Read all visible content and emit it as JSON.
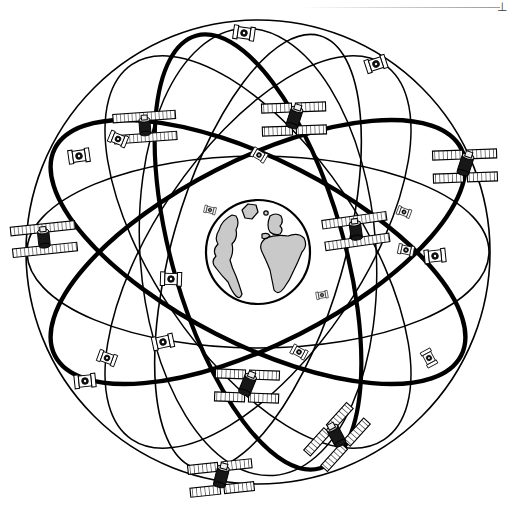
{
  "figure": {
    "background_color": "#ffffff",
    "line_color": "#000000",
    "earth": {
      "label": "Earth",
      "center_x": 258,
      "center_y": 252,
      "radius": 52,
      "ocean_fill": "#ffffff",
      "land_fill": "#c9c9c9",
      "outline_color": "#000000",
      "outline_width": 2.2,
      "view": "Atlantic hemisphere: North America, South America, Europe, Africa, Greenland"
    },
    "orbits": {
      "count": 9,
      "thick_color": "#000000",
      "thin_color": "#000000",
      "thick_width": 4.2,
      "thin_width": 1.5,
      "planes": [
        {
          "name": "outer-sphere-rim",
          "rx": 232,
          "ry": 232,
          "rotation": 0,
          "weight": "thin"
        },
        {
          "name": "equatorial-wide-thin",
          "rx": 231,
          "ry": 96,
          "rotation": 0,
          "weight": "thin"
        },
        {
          "name": "plane-a-thick",
          "rx": 228,
          "ry": 92,
          "rotation": -27,
          "weight": "thick"
        },
        {
          "name": "plane-b-thick",
          "rx": 228,
          "ry": 92,
          "rotation": 27,
          "weight": "thick"
        },
        {
          "name": "plane-c-thick",
          "rx": 225,
          "ry": 86,
          "rotation": 74,
          "weight": "thick"
        },
        {
          "name": "plane-d-thin",
          "rx": 225,
          "ry": 86,
          "rotation": -74,
          "weight": "thin"
        },
        {
          "name": "plane-e-thin",
          "rx": 226,
          "ry": 104,
          "rotation": 56,
          "weight": "thin"
        },
        {
          "name": "plane-f-thin",
          "rx": 226,
          "ry": 104,
          "rotation": -56,
          "weight": "thin"
        },
        {
          "name": "plane-g-thin",
          "rx": 224,
          "ry": 118,
          "rotation": 86,
          "weight": "thin"
        }
      ]
    },
    "satellites": {
      "total": 24,
      "body_color": "#1a1a1a",
      "panel_fill": "#ffffff",
      "panel_stroke": "#000000",
      "types": {
        "near": "four hatched solar-panel wings in an X around a dark cylindrical bus",
        "mid": "two hatched solar-panel wings flanking a dark bus",
        "far": "edge-on silhouette: narrow bracket panels with a dark dot bus"
      },
      "items": [
        {
          "id": "sv-01",
          "x": 244,
          "y": 33,
          "scale": 0.62,
          "rotation": 8,
          "type": "far"
        },
        {
          "id": "sv-02",
          "x": 376,
          "y": 64,
          "scale": 0.62,
          "rotation": -18,
          "type": "far"
        },
        {
          "id": "sv-03",
          "x": 294,
          "y": 119,
          "scale": 1.0,
          "rotation": 18,
          "type": "near"
        },
        {
          "id": "sv-04",
          "x": 145,
          "y": 128,
          "scale": 0.92,
          "rotation": 82,
          "type": "mid"
        },
        {
          "id": "sv-05",
          "x": 118,
          "y": 139,
          "scale": 0.54,
          "rotation": 22,
          "type": "far"
        },
        {
          "id": "sv-06",
          "x": 79,
          "y": 156,
          "scale": 0.62,
          "rotation": -8,
          "type": "far"
        },
        {
          "id": "sv-07",
          "x": 259,
          "y": 155,
          "scale": 0.46,
          "rotation": 30,
          "type": "far"
        },
        {
          "id": "sv-08",
          "x": 465,
          "y": 166,
          "scale": 1.0,
          "rotation": 18,
          "type": "near"
        },
        {
          "id": "sv-09",
          "x": 44,
          "y": 240,
          "scale": 0.95,
          "rotation": 80,
          "type": "mid"
        },
        {
          "id": "sv-10",
          "x": 356,
          "y": 232,
          "scale": 0.95,
          "rotation": 75,
          "type": "mid"
        },
        {
          "id": "sv-11",
          "x": 406,
          "y": 250,
          "scale": 0.46,
          "rotation": 12,
          "type": "far"
        },
        {
          "id": "sv-12",
          "x": 435,
          "y": 256,
          "scale": 0.62,
          "rotation": -6,
          "type": "far"
        },
        {
          "id": "sv-13",
          "x": 171,
          "y": 279,
          "scale": 0.62,
          "rotation": 2,
          "type": "far"
        },
        {
          "id": "sv-14",
          "x": 163,
          "y": 342,
          "scale": 0.62,
          "rotation": -12,
          "type": "far"
        },
        {
          "id": "sv-15",
          "x": 107,
          "y": 358,
          "scale": 0.54,
          "rotation": 20,
          "type": "far"
        },
        {
          "id": "sv-16",
          "x": 85,
          "y": 381,
          "scale": 0.62,
          "rotation": -6,
          "type": "far"
        },
        {
          "id": "sv-17",
          "x": 299,
          "y": 352,
          "scale": 0.46,
          "rotation": 28,
          "type": "far"
        },
        {
          "id": "sv-18",
          "x": 429,
          "y": 358,
          "scale": 0.5,
          "rotation": 62,
          "type": "far"
        },
        {
          "id": "sv-19",
          "x": 247,
          "y": 386,
          "scale": 1.0,
          "rotation": 22,
          "type": "near"
        },
        {
          "id": "sv-20",
          "x": 337,
          "y": 437,
          "scale": 1.0,
          "rotation": -28,
          "type": "near"
        },
        {
          "id": "sv-21",
          "x": 221,
          "y": 478,
          "scale": 1.0,
          "rotation": 14,
          "type": "near"
        },
        {
          "id": "sv-22",
          "x": 404,
          "y": 212,
          "scale": 0.4,
          "rotation": 20,
          "type": "far"
        },
        {
          "id": "sv-23",
          "x": 210,
          "y": 210,
          "scale": 0.34,
          "rotation": 14,
          "type": "far"
        },
        {
          "id": "sv-24",
          "x": 322,
          "y": 295,
          "scale": 0.34,
          "rotation": -10,
          "type": "far"
        }
      ]
    },
    "scan_artifact": {
      "present": true,
      "description": "faint grey page-edge rule with a small serif mark at the top-right corner",
      "mark": "⊥"
    }
  }
}
